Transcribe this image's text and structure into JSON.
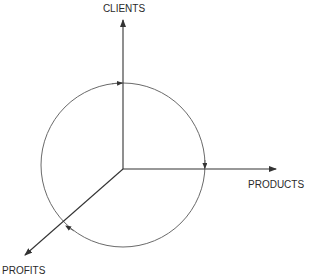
{
  "diagram": {
    "type": "three-axis cycle diagram",
    "axes": [
      {
        "id": "clients",
        "label": "CLIENTS",
        "direction": "up"
      },
      {
        "id": "products",
        "label": "PRODUCTS",
        "direction": "right"
      },
      {
        "id": "profits",
        "label": "PROFITS",
        "direction": "down-left"
      }
    ],
    "cycle": {
      "direction": "clockwise",
      "arrow_count": 3
    },
    "colors": {
      "axis": "#333333",
      "circle": "#6a6a6a",
      "text": "#2a2a2a",
      "background": "#ffffff"
    }
  }
}
